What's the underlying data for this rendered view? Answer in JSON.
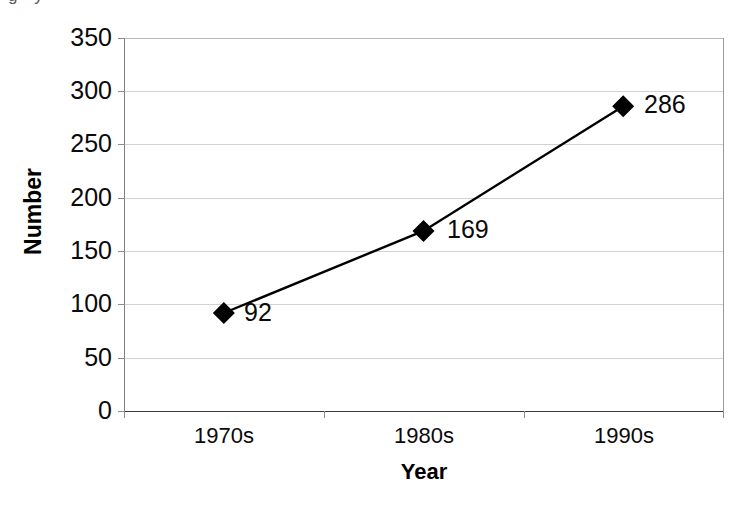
{
  "artifact": {
    "cut_off_text_above": "g y"
  },
  "chart_data": {
    "type": "line",
    "title": "",
    "subtitle": "",
    "categories": [
      "1970s",
      "1980s",
      "1990s"
    ],
    "values": [
      92,
      169,
      286
    ],
    "point_labels": [
      "92",
      "169",
      "286"
    ],
    "series": [
      {
        "name": "Number",
        "values": [
          92,
          169,
          286
        ],
        "marker": "diamond",
        "marker_color": "#000000",
        "line_color": "#000000"
      }
    ],
    "xlabel": "Year",
    "ylabel": "Number",
    "ylim": [
      0,
      350
    ],
    "yticks": [
      0,
      50,
      100,
      150,
      200,
      250,
      300,
      350
    ],
    "ytick_labels": [
      "0",
      "50",
      "100",
      "150",
      "200",
      "250",
      "300",
      "350"
    ],
    "grid": "horizontal",
    "legend": "none",
    "legend_position": "none",
    "background_color": "#ffffff",
    "gridline_color": "#d2d2d2",
    "axis_color": "#3a3a3a"
  }
}
